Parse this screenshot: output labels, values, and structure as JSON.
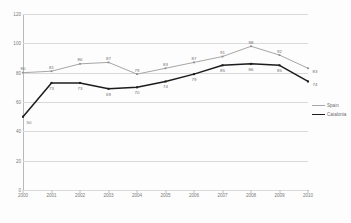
{
  "chart_data": {
    "type": "line",
    "title": "",
    "xlabel": "",
    "ylabel": "",
    "categories": [
      "2000",
      "2001",
      "2002",
      "2003",
      "2004",
      "2005",
      "2006",
      "2007",
      "2008",
      "2009",
      "2010"
    ],
    "ylim": [
      0,
      120
    ],
    "yticks": [
      0,
      20,
      40,
      60,
      80,
      100,
      120
    ],
    "grid": true,
    "legend_position": "right",
    "series": [
      {
        "name": "Spain",
        "color": "#a6a6a6",
        "values": [
          80,
          81,
          86,
          87,
          79,
          83,
          87,
          91,
          98,
          92,
          83
        ],
        "labels": [
          "80",
          "81",
          "86",
          "87",
          "79",
          "83",
          "87",
          "91",
          "98",
          "92",
          "83"
        ]
      },
      {
        "name": "Catalonia",
        "color": "#1c1c1c",
        "values": [
          50,
          73,
          73,
          69,
          70,
          74,
          79,
          85,
          86,
          85,
          74
        ],
        "labels": [
          "50",
          "73",
          "73",
          "69",
          "70",
          "74",
          "79",
          "85",
          "86",
          "85",
          "74"
        ]
      }
    ]
  },
  "legend": {
    "items": [
      {
        "label": "Spain"
      },
      {
        "label": "Catalonia"
      }
    ]
  },
  "axes": {
    "y_tick_labels": [
      "120",
      "100",
      "80",
      "60",
      "40",
      "20",
      "0"
    ],
    "x_tick_labels": [
      "2000",
      "2001",
      "2002",
      "2003",
      "2004",
      "2005",
      "2006",
      "2007",
      "2008",
      "2009",
      "2010"
    ]
  },
  "header": {
    "cropped_title": ""
  }
}
